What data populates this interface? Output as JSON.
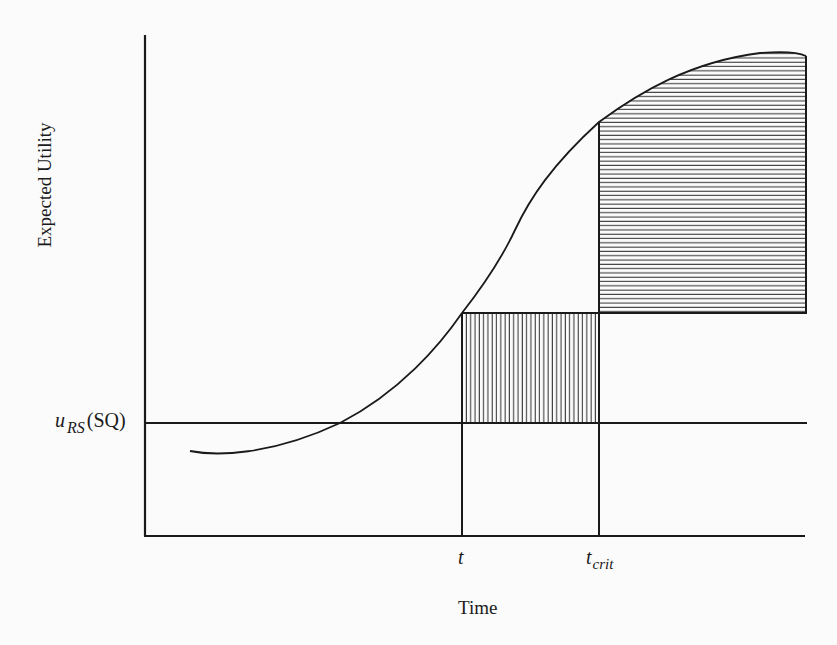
{
  "figure": {
    "type": "diagram",
    "y_axis_label": "Expected Utility",
    "x_axis_label": "Time",
    "reference_line": {
      "label_main": "u",
      "label_sub": "RS",
      "label_suffix": "(SQ)"
    },
    "markers": [
      {
        "id": "t",
        "label": "t",
        "sub": ""
      },
      {
        "id": "t_crit",
        "label": "t",
        "sub": "crit"
      }
    ],
    "regions": [
      {
        "id": "vertical-hatch-region",
        "pattern": "vertical lines",
        "between": "t to t_crit, from u_RS(SQ) up to curve value at t"
      },
      {
        "id": "horizontal-hatch-region",
        "pattern": "horizontal lines",
        "between": "t_crit onward, from curve value at t up to curve"
      }
    ],
    "colors": {
      "ink": "#1a1a1a",
      "background": "#fbfbfb"
    }
  }
}
